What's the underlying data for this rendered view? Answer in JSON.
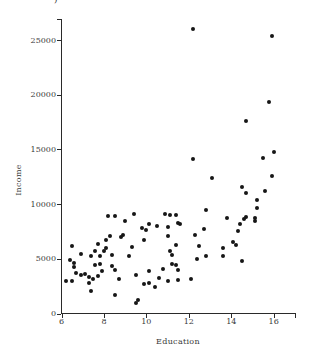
{
  "figure": {
    "stray_mark": ")"
  },
  "chart_data": {
    "type": "scatter",
    "title": "",
    "xlabel": "Education",
    "ylabel": "Income",
    "xlim": [
      6,
      17.05
    ],
    "ylim": [
      0,
      26900
    ],
    "x_ticks": [
      6,
      8,
      10,
      12,
      14,
      16
    ],
    "y_ticks": [
      0,
      5000,
      10000,
      15000,
      20000,
      25000
    ],
    "grid": false,
    "legend": "none",
    "marker": {
      "shape": "circle",
      "color": "#161616",
      "size_px": 4
    },
    "points": [
      [
        12.2,
        26000
      ],
      [
        15.9,
        25400
      ],
      [
        15.8,
        19300
      ],
      [
        14.7,
        17600
      ],
      [
        16.0,
        14800
      ],
      [
        15.5,
        14200
      ],
      [
        12.2,
        14100
      ],
      [
        15.9,
        12600
      ],
      [
        13.1,
        12400
      ],
      [
        14.5,
        11600
      ],
      [
        15.6,
        11200
      ],
      [
        14.7,
        11000
      ],
      [
        15.2,
        10400
      ],
      [
        15.2,
        9650
      ],
      [
        14.7,
        8800
      ],
      [
        14.6,
        8650
      ],
      [
        15.1,
        8750
      ],
      [
        15.1,
        8450
      ],
      [
        14.4,
        8200
      ],
      [
        14.3,
        7500
      ],
      [
        14.1,
        6550
      ],
      [
        14.2,
        6300
      ],
      [
        14.5,
        4800
      ],
      [
        12.8,
        9500
      ],
      [
        10.9,
        9100
      ],
      [
        11.1,
        9000
      ],
      [
        11.4,
        9050
      ],
      [
        13.8,
        8750
      ],
      [
        11.5,
        8300
      ],
      [
        11.6,
        8200
      ],
      [
        10.1,
        8200
      ],
      [
        10.5,
        8000
      ],
      [
        11.0,
        7900
      ],
      [
        12.7,
        7700
      ],
      [
        10.0,
        7600
      ],
      [
        12.3,
        7150
      ],
      [
        11.0,
        7050
      ],
      [
        11.4,
        6300
      ],
      [
        12.5,
        6150
      ],
      [
        13.6,
        6000
      ],
      [
        13.6,
        5250
      ],
      [
        11.1,
        5700
      ],
      [
        11.2,
        5350
      ],
      [
        12.8,
        5250
      ],
      [
        12.4,
        4950
      ],
      [
        11.2,
        4500
      ],
      [
        11.4,
        4400
      ],
      [
        10.8,
        4100
      ],
      [
        11.5,
        4000
      ],
      [
        10.1,
        3850
      ],
      [
        10.6,
        3250
      ],
      [
        12.1,
        3200
      ],
      [
        11.5,
        3100
      ],
      [
        11.0,
        2950
      ],
      [
        10.1,
        2800
      ],
      [
        10.4,
        2450
      ],
      [
        9.4,
        9100
      ],
      [
        8.2,
        8900
      ],
      [
        8.5,
        8900
      ],
      [
        9.0,
        8500
      ],
      [
        9.8,
        7850
      ],
      [
        8.9,
        7150
      ],
      [
        8.3,
        7050
      ],
      [
        8.1,
        6700
      ],
      [
        9.9,
        6700
      ],
      [
        8.8,
        6950
      ],
      [
        7.7,
        6350
      ],
      [
        6.5,
        6150
      ],
      [
        8.1,
        6000
      ],
      [
        9.3,
        6050
      ],
      [
        8.0,
        5750
      ],
      [
        7.6,
        5700
      ],
      [
        6.9,
        5450
      ],
      [
        8.4,
        5350
      ],
      [
        7.4,
        5300
      ],
      [
        7.8,
        5300
      ],
      [
        9.2,
        5250
      ],
      [
        6.4,
        4850
      ],
      [
        6.6,
        4600
      ],
      [
        7.8,
        4500
      ],
      [
        7.6,
        4400
      ],
      [
        8.4,
        4350
      ],
      [
        6.6,
        4250
      ],
      [
        8.5,
        3950
      ],
      [
        7.9,
        3850
      ],
      [
        6.7,
        3700
      ],
      [
        7.1,
        3600
      ],
      [
        6.9,
        3550
      ],
      [
        9.5,
        3550
      ],
      [
        7.7,
        3400
      ],
      [
        7.3,
        3300
      ],
      [
        8.7,
        3200
      ],
      [
        7.5,
        3200
      ],
      [
        6.5,
        3000
      ],
      [
        6.2,
        2950
      ],
      [
        7.3,
        2800
      ],
      [
        9.9,
        2700
      ],
      [
        7.4,
        2100
      ],
      [
        8.5,
        1700
      ],
      [
        9.6,
        1200
      ],
      [
        9.5,
        1000
      ]
    ]
  }
}
